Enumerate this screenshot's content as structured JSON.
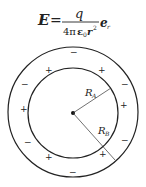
{
  "formula": {
    "lhs": "E",
    "equals": "=",
    "numerator": "q",
    "denominator": "4πε₀r²",
    "denominator_parts": {
      "four_pi": "4π",
      "eps": "ε",
      "eps_sub": "0",
      "r": "r",
      "r_sup": "2"
    },
    "unit_vector": "e",
    "unit_vector_sub": "r"
  },
  "diagram": {
    "inner_label": "R",
    "inner_label_sub": "A",
    "outer_label": "R",
    "outer_label_sub": "B",
    "plus": "+",
    "minus": "−"
  }
}
